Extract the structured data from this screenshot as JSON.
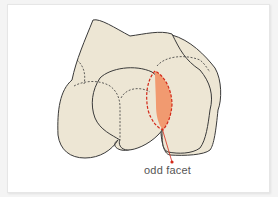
{
  "figure": {
    "label": "odd facet",
    "colors": {
      "bone_fill": "#ede6d4",
      "outline": "#3a3a3a",
      "facet_fill": "#f19a70",
      "facet_outline": "#d42a1a",
      "leader_line": "#d42a1a",
      "frame": "#ffffff"
    }
  }
}
